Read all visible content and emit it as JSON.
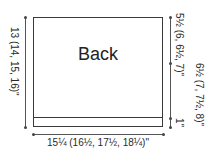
{
  "piece": {
    "title": "Back"
  },
  "dimensions": {
    "length": "13 (14, 15, 16)\"",
    "width": "15¼ (16½, 17½, 18¼)\"",
    "upper_section": "5½ (6, 6½, 7)\"",
    "lower_section": "6½ (7, 7½, 8)\"",
    "hem": "1\""
  },
  "colors": {
    "line": "#3a3a3a",
    "text": "#2a2a2a",
    "background": "#ffffff"
  }
}
